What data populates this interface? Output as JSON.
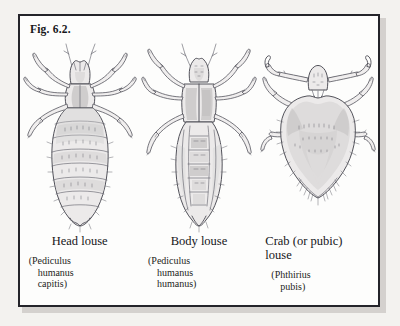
{
  "figure": {
    "label": "Fig. 6.2."
  },
  "specimens": [
    {
      "id": "head-louse",
      "common_name": "Head louse",
      "scientific_name_lines": [
        "(Pediculus",
        "humanus",
        "capitis)"
      ]
    },
    {
      "id": "body-louse",
      "common_name": "Body louse",
      "scientific_name_lines": [
        "(Pediculus",
        "humanus",
        "humanus)"
      ]
    },
    {
      "id": "crab-louse",
      "common_name_lines": [
        "Crab (or pubic)",
        "louse"
      ],
      "scientific_name_lines": [
        "(Phthirius",
        "pubis)"
      ]
    }
  ],
  "colors": {
    "frame_border": "#24242a",
    "page_background": "#f3f2ef",
    "plate_background": "#fdfdfc",
    "ink": "#4a4a52"
  }
}
